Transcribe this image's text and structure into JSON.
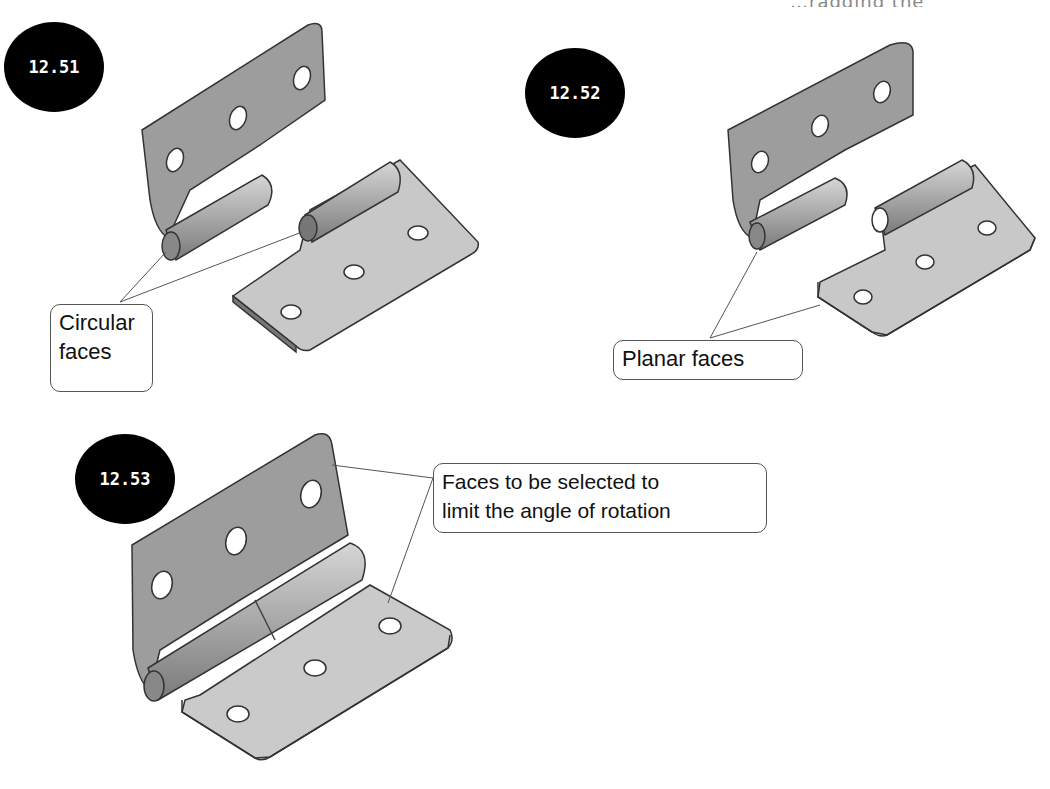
{
  "header": {
    "cropped_text": "…ragging the components…"
  },
  "figures": [
    {
      "id": "12.51",
      "badge": "12.51",
      "callout": {
        "line1": "Circular",
        "line2": "faces"
      }
    },
    {
      "id": "12.52",
      "badge": "12.52",
      "callout": {
        "line1": "Planar faces"
      }
    },
    {
      "id": "12.53",
      "badge": "12.53",
      "callout": {
        "line1": "Faces to be selected to",
        "line2": "limit the angle of rotation"
      }
    }
  ],
  "colors": {
    "badge_bg": "#000000",
    "leaf_dark": "#9a9a9a",
    "leaf_light": "#c9c9c9",
    "outline": "#333333"
  }
}
